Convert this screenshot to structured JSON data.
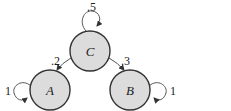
{
  "diagram": {
    "type": "markov-chain",
    "nodes": [
      {
        "id": "C",
        "label": "C",
        "cx": 90,
        "cy": 51,
        "r": 20
      },
      {
        "id": "A",
        "label": "A",
        "cx": 50,
        "cy": 90,
        "r": 20
      },
      {
        "id": "B",
        "label": "B",
        "cx": 130,
        "cy": 90,
        "r": 20
      }
    ],
    "edges": [
      {
        "from": "C",
        "to": "C",
        "label": ".5"
      },
      {
        "from": "C",
        "to": "A",
        "label": ".2"
      },
      {
        "from": "C",
        "to": "B",
        "label": ".3"
      },
      {
        "from": "A",
        "to": "A",
        "label": "1"
      },
      {
        "from": "B",
        "to": "B",
        "label": "1"
      }
    ]
  }
}
